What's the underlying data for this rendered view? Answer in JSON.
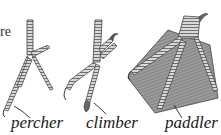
{
  "figure": {
    "fragment_text": "re",
    "feet": [
      {
        "id": "percher",
        "label": "percher"
      },
      {
        "id": "climber",
        "label": "climber"
      },
      {
        "id": "paddler",
        "label": "paddler"
      }
    ]
  },
  "colors": {
    "ink": "#3a3a3a",
    "web_fill": "#8a8a8a",
    "scale_light": "#d8d8d8"
  }
}
